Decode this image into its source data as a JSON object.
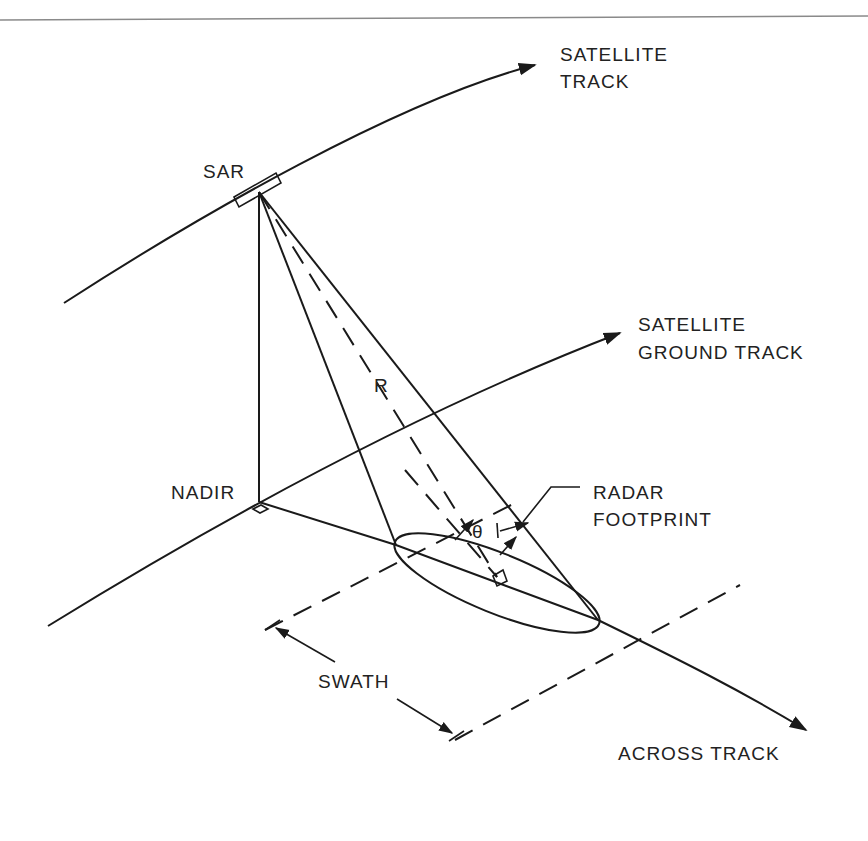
{
  "diagram": {
    "type": "SAR imaging geometry",
    "labels": {
      "satellite_track_1": "SATELLITE",
      "satellite_track_2": "TRACK",
      "sar": "SAR",
      "ground_track_1": "SATELLITE",
      "ground_track_2": "GROUND TRACK",
      "range": "R",
      "nadir": "NADIR",
      "footprint_1": "RADAR",
      "footprint_2": "FOOTPRINT",
      "theta": "θ",
      "swath": "SWATH",
      "across_track": "ACROSS TRACK"
    },
    "colors": {
      "line": "#1a1a1a",
      "text": "#222222",
      "rule": "#8a8a8a",
      "background": "#ffffff"
    }
  }
}
